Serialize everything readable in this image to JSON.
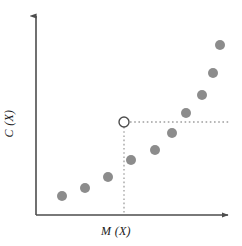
{
  "figure": {
    "type": "scatter-plot",
    "width": 242,
    "height": 246,
    "background_color": "#ffffff"
  },
  "axes": {
    "x_label": "M (X)",
    "y_label": "C (X)",
    "x_axis_name": "M (X)",
    "y_axis_name": "C (X)",
    "line_color": "#4d4d4d",
    "arrow_heads": true,
    "ticks_shown": false,
    "tick_labels": [],
    "origin_px": {
      "x": 36,
      "y": 215
    },
    "x_axis_end_px": {
      "x": 232,
      "y": 215
    },
    "y_axis_end_px": {
      "x": 36,
      "y": 12
    }
  },
  "markers": {
    "point_color": "#8c8c8c",
    "point_radius": 5,
    "highlight_color": "#ffffff",
    "highlight_stroke": "#4d4d4d",
    "highlight_radius": 5,
    "guide_color": "#9e9e9e"
  },
  "guides": {
    "vertical": {
      "name": "vertical-dotted-guide",
      "x": 124,
      "y_top": 127,
      "y_bottom": 215
    },
    "horizontal": {
      "name": "horizontal-dotted-guide",
      "y": 122,
      "x_left": 130,
      "x_right": 230
    }
  },
  "chart_data": {
    "type": "scatter",
    "title": "",
    "subtitle": "",
    "xlabel": "M (X)",
    "ylabel": "C (X)",
    "xlim": [
      0,
      10
    ],
    "ylim": [
      0,
      10
    ],
    "grid": false,
    "legend": null,
    "legend_position": "none",
    "axis_ticks": false,
    "series": [
      {
        "name": "observations",
        "marker": "filled-circle",
        "color": "#8c8c8c",
        "points_px": [
          {
            "x": 62,
            "y": 196
          },
          {
            "x": 85,
            "y": 188
          },
          {
            "x": 108,
            "y": 177
          },
          {
            "x": 131,
            "y": 160
          },
          {
            "x": 155,
            "y": 150
          },
          {
            "x": 172,
            "y": 133
          },
          {
            "x": 186,
            "y": 113
          },
          {
            "x": 202,
            "y": 95
          },
          {
            "x": 213,
            "y": 73
          },
          {
            "x": 220,
            "y": 45
          }
        ],
        "x": [
          1.33,
          2.5,
          3.67,
          4.85,
          6.07,
          6.94,
          7.65,
          8.47,
          9.03,
          9.39
        ],
        "y": [
          0.94,
          1.33,
          1.87,
          2.71,
          3.2,
          4.04,
          5.02,
          5.91,
          6.99,
          8.37
        ]
      },
      {
        "name": "threshold-point",
        "marker": "open-circle",
        "color": "#ffffff",
        "stroke": "#4d4d4d",
        "points_px": [
          {
            "x": 124,
            "y": 122
          }
        ],
        "x": [
          4.49
        ],
        "y": [
          4.58
        ]
      }
    ],
    "annotations": [
      {
        "name": "threshold-guides",
        "type": "dotted-crosshair",
        "x_px": 124,
        "y_px": 122,
        "description": "dotted vertical line from open circle down to x-axis and dotted horizontal line extending to the right"
      }
    ]
  }
}
